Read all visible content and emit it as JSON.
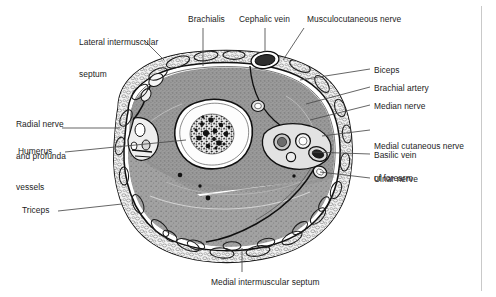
{
  "figure": {
    "title_semantic": "cross-section-of-mid-arm",
    "background_color": "#ffffff",
    "ink_color": "#1c1c1c",
    "border_color": "#c9c9c9",
    "leader_line_color": "#4a4a4a"
  },
  "labels": [
    {
      "id": "lateral-intermuscular-septum",
      "text_lines": [
        "Lateral intermuscular",
        "septum"
      ],
      "line1": "Lateral intermuscular",
      "line2": "septum",
      "x": 79,
      "y": 16,
      "align": "left"
    },
    {
      "id": "brachialis",
      "text_lines": [
        "Brachialis"
      ],
      "line1": "Brachialis",
      "x": 188,
      "y": 14,
      "align": "left"
    },
    {
      "id": "cephalic-vein",
      "text_lines": [
        "Cephalic vein"
      ],
      "line1": "Cephalic vein",
      "x": 239,
      "y": 14,
      "align": "left"
    },
    {
      "id": "musculocutaneous-nerve",
      "text_lines": [
        "Musculocutaneous nerve"
      ],
      "line1": "Musculocutaneous nerve",
      "x": 307,
      "y": 14,
      "align": "left"
    },
    {
      "id": "radial-nerve-and-profunda-vessels",
      "text_lines": [
        "Radial nerve",
        "and profunda",
        "vessels"
      ],
      "line1": "Radial nerve",
      "line2": "and profunda",
      "line3": "vessels",
      "x": 16,
      "y": 98,
      "align": "left"
    },
    {
      "id": "humerus",
      "text_lines": [
        "Humerus"
      ],
      "line1": "Humerus",
      "x": 18,
      "y": 146,
      "align": "left"
    },
    {
      "id": "triceps",
      "text_lines": [
        "Triceps"
      ],
      "line1": "Triceps",
      "x": 22,
      "y": 205,
      "align": "left"
    },
    {
      "id": "biceps",
      "text_lines": [
        "Biceps"
      ],
      "line1": "Biceps",
      "x": 374,
      "y": 65,
      "align": "left"
    },
    {
      "id": "brachial-artery",
      "text_lines": [
        "Brachial artery"
      ],
      "line1": "Brachial artery",
      "x": 374,
      "y": 83,
      "align": "left"
    },
    {
      "id": "median-nerve",
      "text_lines": [
        "Median nerve"
      ],
      "line1": "Median nerve",
      "x": 374,
      "y": 101,
      "align": "left"
    },
    {
      "id": "medial-cutaneous-nerve-of-forearm",
      "text_lines": [
        "Medial cutaneous nerve",
        "of forearm"
      ],
      "line1": "Medial cutaneous nerve",
      "line2": "of forearm",
      "x": 374,
      "y": 120,
      "align": "left"
    },
    {
      "id": "basilic-vein",
      "text_lines": [
        "Basilic vein"
      ],
      "line1": "Basilic vein",
      "x": 374,
      "y": 150,
      "align": "left"
    },
    {
      "id": "ulnar-nerve",
      "text_lines": [
        "Ulnar nerve"
      ],
      "line1": "Ulnar nerve",
      "x": 374,
      "y": 174,
      "align": "left"
    },
    {
      "id": "medial-intermuscular-septum",
      "text_lines": [
        "Medial intermuscular septum"
      ],
      "line1": "Medial intermuscular septum",
      "x": 211,
      "y": 277,
      "align": "left"
    }
  ],
  "leader_lines": [
    {
      "id": "leader-lateral-intermuscular-septum",
      "points": "144,40 163,58"
    },
    {
      "id": "leader-brachialis",
      "points": "203,27 203,66"
    },
    {
      "id": "leader-cephalic-vein",
      "points": "265,27 265,52"
    },
    {
      "id": "leader-musculocutaneous-nerve",
      "points": "303,27 285,58"
    },
    {
      "id": "leader-radial-nerve",
      "points": "62,128 117,128"
    },
    {
      "id": "leader-humerus",
      "points": "65,152 160,152"
    },
    {
      "id": "leader-triceps",
      "points": "58,211 118,211"
    },
    {
      "id": "leader-biceps",
      "points": "370,69 300,81"
    },
    {
      "id": "leader-brachial-artery",
      "points": "370,87 305,104"
    },
    {
      "id": "leader-median-nerve",
      "points": "370,105 307,119"
    },
    {
      "id": "leader-medial-cutaneous-nerve",
      "points": "370,130 318,135"
    },
    {
      "id": "leader-basilic-vein",
      "points": "370,154 310,152"
    },
    {
      "id": "leader-ulnar-nerve",
      "points": "370,178 318,172"
    },
    {
      "id": "leader-medial-intermuscular-septum",
      "points": "242,272 242,246"
    }
  ],
  "structures": [
    {
      "id": "skin-outline",
      "name": "skin and subcutaneous boundary"
    },
    {
      "id": "subcutaneous-fat-ring",
      "name": "subcutaneous fat layer"
    },
    {
      "id": "deep-fascia",
      "name": "brachial fascia"
    },
    {
      "id": "humerus-shaft",
      "name": "humerus cortical shaft"
    },
    {
      "id": "medullary-cavity",
      "name": "medullary cavity with trabeculae"
    },
    {
      "id": "brachialis-muscle",
      "name": "brachialis muscle belly"
    },
    {
      "id": "biceps-muscle",
      "name": "biceps brachii muscle belly"
    },
    {
      "id": "triceps-muscle",
      "name": "triceps brachii muscle belly"
    },
    {
      "id": "lateral-septum-line",
      "name": "lateral intermuscular septum"
    },
    {
      "id": "medial-septum-line",
      "name": "medial intermuscular septum"
    },
    {
      "id": "neurovascular-bundle",
      "name": "medial neurovascular bundle"
    },
    {
      "id": "cephalic-vein-lumen",
      "name": "cephalic vein"
    },
    {
      "id": "basilic-vein-lumen",
      "name": "basilic vein"
    },
    {
      "id": "brachial-artery-lumen",
      "name": "brachial artery"
    },
    {
      "id": "median-nerve-body",
      "name": "median nerve"
    },
    {
      "id": "ulnar-nerve-body",
      "name": "ulnar nerve"
    },
    {
      "id": "musculocutaneous-nerve-body",
      "name": "musculocutaneous nerve"
    },
    {
      "id": "radial-nerve-body",
      "name": "radial nerve and profunda vessels"
    }
  ]
}
